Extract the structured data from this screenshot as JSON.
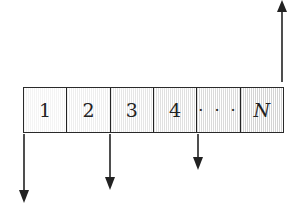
{
  "diagram": {
    "cells": [
      {
        "label": "1",
        "shade": "#f4f4f4",
        "italic": false
      },
      {
        "label": "2",
        "shade": "#eeeeee",
        "italic": false
      },
      {
        "label": "3",
        "shade": "#e6e6e6",
        "italic": false
      },
      {
        "label": "4",
        "shade": "#e0e0e0",
        "italic": false
      },
      {
        "label": "· · ·",
        "shade": "#dadada",
        "italic": false
      },
      {
        "label": "N",
        "shade": "#d4d4d4",
        "italic": true
      }
    ],
    "arrows": [
      {
        "id": "down-1",
        "direction": "down",
        "x": 24,
        "y_start": 134,
        "y_end": 202
      },
      {
        "id": "down-2",
        "direction": "down",
        "x": 110,
        "y_start": 134,
        "y_end": 189
      },
      {
        "id": "down-3",
        "direction": "down",
        "x": 198,
        "y_start": 134,
        "y_end": 169
      },
      {
        "id": "up-N",
        "direction": "up",
        "x": 282,
        "y_start": 82,
        "y_end": 1
      }
    ],
    "colors": {
      "line": "#222222",
      "background": "#ffffff"
    }
  }
}
